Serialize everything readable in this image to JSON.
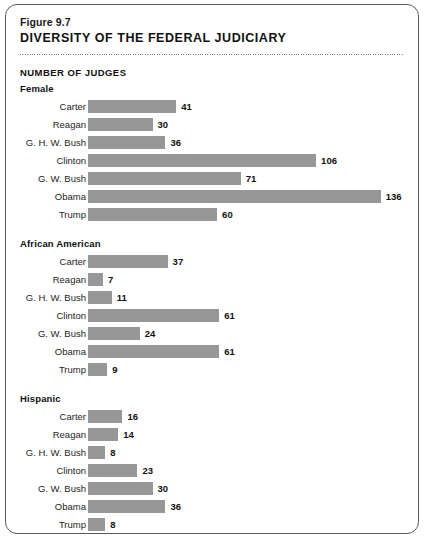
{
  "figure": {
    "number": "Figure 9.7",
    "title": "DIVERSITY OF THE FEDERAL JUDICIARY",
    "units_label": "NUMBER OF JUDGES"
  },
  "colors": {
    "bar": "#979797",
    "panel_border": "#5a5a5a",
    "text": "#111111",
    "background": "#ffffff"
  },
  "chart_data": {
    "type": "bar",
    "title": "DIVERSITY OF THE FEDERAL JUDICIARY",
    "subtitle": "Figure 9.7",
    "xlabel": "NUMBER OF JUDGES",
    "ylabel": "",
    "orientation": "horizontal",
    "grid": false,
    "legend": "none",
    "xlim": [
      0,
      140
    ],
    "categories": [
      "Carter",
      "Reagan",
      "G. H. W. Bush",
      "Clinton",
      "G. W. Bush",
      "Obama",
      "Trump"
    ],
    "groups": [
      {
        "name": "Female",
        "categories": [
          "Carter",
          "Reagan",
          "G. H. W. Bush",
          "Clinton",
          "G. W. Bush",
          "Obama",
          "Trump"
        ],
        "values": [
          41,
          30,
          36,
          106,
          71,
          136,
          60
        ]
      },
      {
        "name": "African American",
        "categories": [
          "Carter",
          "Reagan",
          "G. H. W. Bush",
          "Clinton",
          "G. W. Bush",
          "Obama",
          "Trump"
        ],
        "values": [
          37,
          7,
          11,
          61,
          24,
          61,
          9
        ]
      },
      {
        "name": "Hispanic",
        "categories": [
          "Carter",
          "Reagan",
          "G. H. W. Bush",
          "Clinton",
          "G. W. Bush",
          "Obama",
          "Trump"
        ],
        "values": [
          16,
          14,
          8,
          23,
          30,
          36,
          8
        ]
      }
    ]
  }
}
